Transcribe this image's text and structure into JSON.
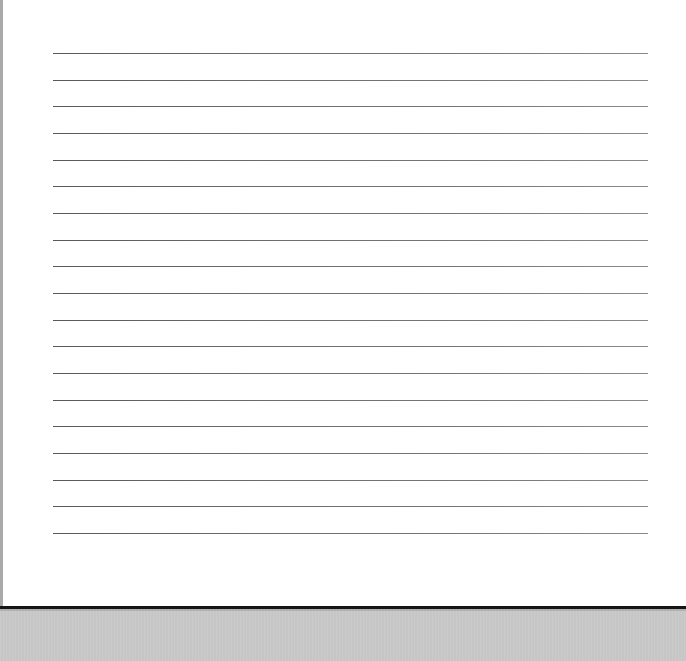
{
  "document": {
    "type": "lined-sheet",
    "text": "",
    "ruled_lines": {
      "count": 19,
      "first_y": 53,
      "spacing": 26.67,
      "x_start": 50,
      "x_end": 645,
      "color": "#6e6e6e"
    },
    "colors": {
      "page": "#ffffff",
      "left_border": "#a9a9a9",
      "bottom_edge": "#151515",
      "background": "#c8c8c8"
    }
  }
}
